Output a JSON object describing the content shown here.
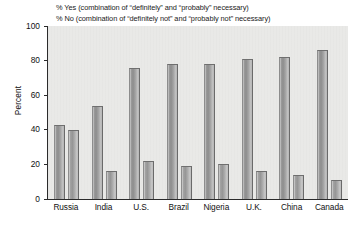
{
  "chart_data": {
    "type": "bar",
    "title": "",
    "xlabel": "",
    "ylabel": "Percent",
    "ylim": [
      0,
      100
    ],
    "yticks": [
      0,
      20,
      40,
      60,
      80,
      100
    ],
    "grid": false,
    "legend_position": "top",
    "categories": [
      "Russia",
      "India",
      "U.S.",
      "Brazil",
      "Nigeria",
      "U.K.",
      "China",
      "Canada"
    ],
    "series": [
      {
        "name": "% Yes (combination of \"definitely\" and \"probably\" necessary)",
        "short_name": "% Yes",
        "values": [
          43,
          54,
          76,
          78,
          78,
          81,
          82,
          86
        ]
      },
      {
        "name": "% No (combination of \"definitely not\" and \"probably not\" necessary)",
        "short_name": "% No",
        "values": [
          40,
          16,
          22,
          19,
          20,
          16,
          14,
          11
        ]
      }
    ]
  },
  "legend": {
    "line1": "% Yes (combination of “definitely” and “probably” necessary)",
    "line2": "% No (combination of “definitely not” and “probably not” necessary)"
  },
  "axis": {
    "ylabel": "Percent",
    "ytick_labels": [
      "100",
      "80",
      "60",
      "40",
      "20",
      "0"
    ]
  },
  "colors": {
    "plot_background": "#e9e9e7",
    "axis_line": "#2b2b2b",
    "bar_yes": "#9a9a9a",
    "bar_no": "#a2a2a2",
    "page_background": "#ffffff",
    "text": "#111111"
  }
}
